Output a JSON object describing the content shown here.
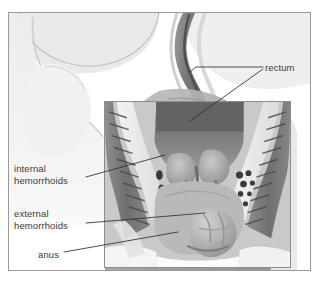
{
  "figure": {
    "type": "medical-illustration",
    "style": "grayscale cross-section of rectum and anus with magnified inset"
  },
  "colors": {
    "frame_border": "#9a9a9a",
    "inset_border": "#8d8d8d",
    "leader_line": "#2e2e2e",
    "label_text": "#3b3b3b",
    "background": "#ffffff",
    "pale_tissue": "#e8e8e8",
    "mid_tissue": "#b4b4b4",
    "dark_tissue": "#6d6d6d",
    "lumen_dark": "#555555"
  },
  "labels": [
    {
      "id": "rectum",
      "text": "rectum"
    },
    {
      "id": "internal_hemorrhoids",
      "text": "internal\nhemorrhoids"
    },
    {
      "id": "external_hemorrhoids",
      "text": "external\nhemorrhoids"
    },
    {
      "id": "anus",
      "text": "anus"
    }
  ],
  "leaders": [
    {
      "id": "rectum-upper",
      "from": "rectum label",
      "to": "rectal canal wall"
    },
    {
      "id": "rectum-inset",
      "from": "rectum label",
      "to": "rectal lumen in inset"
    },
    {
      "id": "internal-hemorrhoids",
      "from": "internal hemorrhoids label",
      "to": "internal hemorrhoid bulges"
    },
    {
      "id": "external-hemorrhoids",
      "from": "external hemorrhoids label",
      "to": "external hemorrhoid mass"
    },
    {
      "id": "anus",
      "from": "anus label",
      "to": "anal opening"
    }
  ]
}
